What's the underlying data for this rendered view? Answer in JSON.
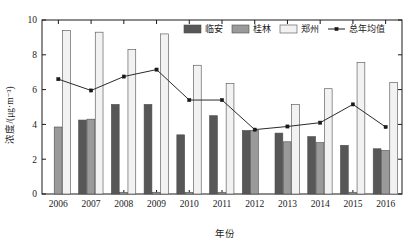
{
  "chart_data": {
    "type": "bar",
    "title": "",
    "subtitle": "",
    "xlabel": "年份",
    "ylabel": "浓度/(μg·m⁻³)",
    "categories": [
      "2006",
      "2007",
      "2008",
      "2009",
      "2010",
      "2011",
      "2012",
      "2013",
      "2014",
      "2015",
      "2016"
    ],
    "ylim": [
      0,
      10
    ],
    "yticks": [
      0,
      2,
      4,
      6,
      8,
      10
    ],
    "ytick_labels": [
      "0",
      "2",
      "4",
      "6",
      "8",
      "10"
    ],
    "grid": false,
    "legend_position": "top-right-inside",
    "series": [
      {
        "name": "临安",
        "kind": "bar",
        "color": "#575757",
        "values": [
          0,
          4.25,
          5.15,
          5.15,
          3.4,
          4.5,
          3.65,
          3.5,
          3.3,
          2.8,
          2.6
        ]
      },
      {
        "name": "桂林",
        "kind": "bar",
        "color": "#9a9a9a",
        "values": [
          3.85,
          4.3,
          0.1,
          0.1,
          0.1,
          0.1,
          3.65,
          3.0,
          2.95,
          0.1,
          2.5
        ]
      },
      {
        "name": "郑州",
        "kind": "bar",
        "color": "#f2f2f2",
        "values": [
          9.4,
          9.3,
          8.3,
          9.2,
          7.4,
          6.35,
          0,
          5.15,
          6.05,
          7.55,
          6.4
        ]
      },
      {
        "name": "总年均值",
        "kind": "line",
        "color": "#1a1a1a",
        "values": [
          6.6,
          5.95,
          6.75,
          7.15,
          5.4,
          5.4,
          3.7,
          3.88,
          4.1,
          5.15,
          3.85
        ]
      }
    ]
  },
  "legend": {
    "items": [
      {
        "label": "临安"
      },
      {
        "label": "桂林"
      },
      {
        "label": "郑州"
      },
      {
        "label": "总年均值"
      }
    ]
  },
  "axes": {
    "y_title": "浓度/(μg·m⁻³)",
    "x_title": "年份"
  }
}
